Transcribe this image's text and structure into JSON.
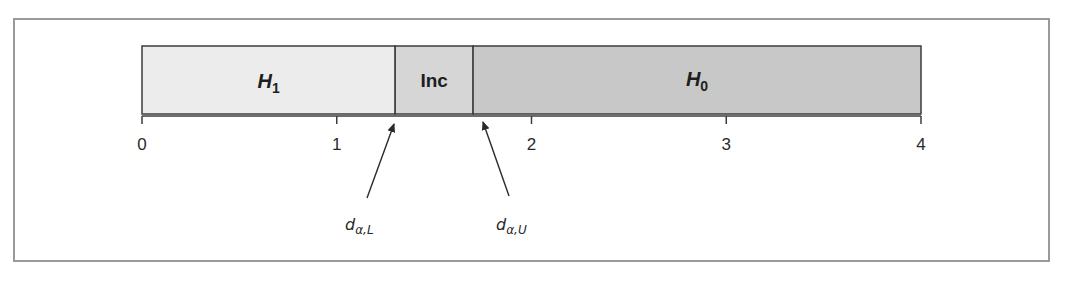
{
  "diagram": {
    "type": "decision-regions-number-line",
    "axis": {
      "min": 0,
      "max": 4,
      "ticks": [
        {
          "value": 0,
          "label": "0"
        },
        {
          "value": 1,
          "label": "1"
        },
        {
          "value": 2,
          "label": "2"
        },
        {
          "value": 3,
          "label": "3"
        },
        {
          "value": 4,
          "label": "4"
        }
      ]
    },
    "regions": [
      {
        "id": "h1",
        "label_main": "H",
        "label_sub": "1",
        "from": 0,
        "to": 1.3,
        "color": "#ececec"
      },
      {
        "id": "inc",
        "label_main": "Inc",
        "label_sub": "",
        "from": 1.3,
        "to": 1.7,
        "color": "#d6d6d6"
      },
      {
        "id": "h0",
        "label_main": "H",
        "label_sub": "0",
        "from": 1.7,
        "to": 4,
        "color": "#c8c8c8"
      }
    ],
    "critical_values": [
      {
        "id": "lower",
        "symbol": "d",
        "subscript": "α,L",
        "points_to": 1.3
      },
      {
        "id": "upper",
        "symbol": "d",
        "subscript": "α,U",
        "points_to": 1.7
      }
    ],
    "colors": {
      "frame": "#9a9a9a",
      "outline": "#3c3c3c",
      "text": "#1e1e1e"
    }
  }
}
